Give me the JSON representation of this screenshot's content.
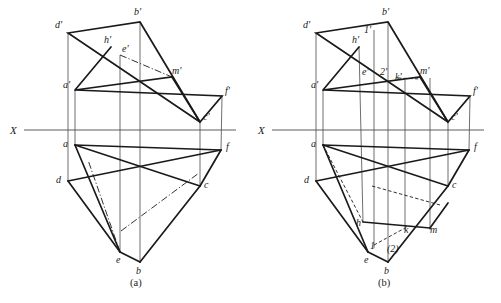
{
  "sheet": {
    "width": 501,
    "height": 303,
    "background": "#ffffff",
    "ink": "#1a1a1a",
    "thin_ink": "#4a4a4a"
  },
  "figures": [
    {
      "id": "figure-a",
      "caption": "(a)",
      "caption_pos": {
        "x": 130,
        "y": 286
      },
      "axis": {
        "name": "X",
        "label": "X",
        "label_pos": {
          "x": 10,
          "y": 134
        },
        "y": 130,
        "x1": 24,
        "x2": 236
      },
      "points": {
        "d_prime": {
          "label": "d'",
          "x": 68,
          "y": 33,
          "lx": 55,
          "ly": 28
        },
        "b_prime": {
          "label": "b'",
          "x": 140,
          "y": 22,
          "lx": 134,
          "ly": 15
        },
        "h_prime": {
          "label": "h'",
          "x": 111,
          "y": 47,
          "lx": 104,
          "ly": 43
        },
        "e_prime": {
          "label": "e'",
          "x": 120,
          "y": 55,
          "lx": 122,
          "ly": 52
        },
        "m_prime": {
          "label": "m'",
          "x": 172,
          "y": 77,
          "lx": 172,
          "ly": 74
        },
        "a_prime": {
          "label": "a'",
          "x": 75,
          "y": 90,
          "lx": 63,
          "ly": 88
        },
        "f_prime": {
          "label": "f'",
          "x": 222,
          "y": 96,
          "lx": 225,
          "ly": 94
        },
        "c_prime": {
          "label": "c'",
          "x": 200,
          "y": 122,
          "lx": 203,
          "ly": 120
        },
        "a": {
          "label": "a",
          "x": 75,
          "y": 145,
          "lx": 63,
          "ly": 147
        },
        "f": {
          "label": "f",
          "x": 221,
          "y": 150,
          "lx": 226,
          "ly": 150
        },
        "d": {
          "label": "d",
          "x": 68,
          "y": 181,
          "lx": 56,
          "ly": 183
        },
        "c": {
          "label": "c",
          "x": 200,
          "y": 186,
          "lx": 204,
          "ly": 188
        },
        "e": {
          "label": "e",
          "x": 120,
          "y": 252,
          "lx": 116,
          "ly": 263
        },
        "b": {
          "label": "b",
          "x": 140,
          "y": 262,
          "lx": 136,
          "ly": 274
        }
      },
      "solid_paths": [
        {
          "name": "top-view-triangle-dbm",
          "d": "M 68 33 L 140 22 L 200 122 Z"
        },
        {
          "name": "front-quad-a-m-c-f",
          "d": "M 75 90 L 172 77 L 200 122 L 222 96 Z"
        },
        {
          "name": "front-left-edge-a-h",
          "d": "M 75 90 L 111 47"
        },
        {
          "name": "bottom-poly-a-f",
          "d": "M 75 145 L 221 150"
        },
        {
          "name": "bottom-poly-a-c",
          "d": "M 75 145 L 200 186"
        },
        {
          "name": "bottom-poly-d-f",
          "d": "M 68 181 L 221 150"
        },
        {
          "name": "bottom-poly-a-e",
          "d": "M 75 145 L 120 252"
        },
        {
          "name": "bottom-poly-d-e",
          "d": "M 68 181 L 120 252"
        },
        {
          "name": "bottom-poly-e-b",
          "d": "M 120 252 L 140 262"
        },
        {
          "name": "bottom-poly-b-c",
          "d": "M 140 262 L 200 186"
        },
        {
          "name": "bottom-poly-c-f",
          "d": "M 200 186 L 221 150"
        }
      ],
      "thin_paths": [
        {
          "name": "proj-line-d",
          "d": "M 68 33 L 68 181"
        },
        {
          "name": "proj-line-a",
          "d": "M 75 90 L 75 145"
        },
        {
          "name": "proj-line-e",
          "d": "M 120 55 L 120 252"
        },
        {
          "name": "proj-line-b",
          "d": "M 140 22 L 140 262"
        },
        {
          "name": "proj-line-c",
          "d": "M 200 122 L 200 186"
        },
        {
          "name": "proj-line-f",
          "d": "M 222 96 L 221 150"
        }
      ],
      "dashdot_paths": [
        {
          "name": "center-line-e-m",
          "d": "M 120 55 L 172 77"
        },
        {
          "name": "center-line-e-mid",
          "d": "M 120 252 L 88 160"
        },
        {
          "name": "center-line-mid-c",
          "d": "M 121 231 L 199 173"
        }
      ]
    },
    {
      "id": "figure-b",
      "caption": "(b)",
      "caption_pos": {
        "x": 378,
        "y": 286
      },
      "axis": {
        "name": "X",
        "label": "X",
        "label_pos": {
          "x": 258,
          "y": 134
        },
        "y": 130,
        "x1": 272,
        "x2": 484
      },
      "points": {
        "d_prime": {
          "label": "d'",
          "x": 316,
          "y": 33,
          "lx": 303,
          "ly": 28
        },
        "b_prime": {
          "label": "b'",
          "x": 388,
          "y": 22,
          "lx": 382,
          "ly": 15
        },
        "one_prime": {
          "label": "1'",
          "x": 368,
          "y": 35,
          "lx": 364,
          "ly": 33
        },
        "h_prime": {
          "label": "h'",
          "x": 359,
          "y": 47,
          "lx": 352,
          "ly": 43
        },
        "e_prime": {
          "label": "e'",
          "x": 368,
          "y": 72,
          "lx": 362,
          "ly": 75
        },
        "two_prime": {
          "label": "2'",
          "x": 383,
          "y": 72,
          "lx": 380,
          "ly": 75
        },
        "k_prime": {
          "label": "k'",
          "x": 398,
          "y": 78,
          "lx": 395,
          "ly": 80
        },
        "m_prime": {
          "label": "m'",
          "x": 420,
          "y": 77,
          "lx": 420,
          "ly": 74
        },
        "a_prime": {
          "label": "a'",
          "x": 323,
          "y": 90,
          "lx": 311,
          "ly": 88
        },
        "f_prime": {
          "label": "f'",
          "x": 470,
          "y": 96,
          "lx": 473,
          "ly": 94
        },
        "c_prime": {
          "label": "c'",
          "x": 448,
          "y": 122,
          "lx": 451,
          "ly": 120
        },
        "a": {
          "label": "a",
          "x": 323,
          "y": 145,
          "lx": 311,
          "ly": 147
        },
        "f": {
          "label": "f",
          "x": 469,
          "y": 150,
          "lx": 474,
          "ly": 150
        },
        "d": {
          "label": "d",
          "x": 316,
          "y": 181,
          "lx": 304,
          "ly": 183
        },
        "c": {
          "label": "c",
          "x": 448,
          "y": 186,
          "lx": 452,
          "ly": 188
        },
        "h": {
          "label": "h",
          "x": 363,
          "y": 222,
          "lx": 356,
          "ly": 226
        },
        "k": {
          "label": "k",
          "x": 405,
          "y": 228,
          "lx": 404,
          "ly": 233
        },
        "m": {
          "label": "m",
          "x": 430,
          "y": 228,
          "lx": 430,
          "ly": 233
        },
        "one": {
          "label": "1",
          "x": 374,
          "y": 245,
          "lx": 370,
          "ly": 249
        },
        "two": {
          "label": "(2)",
          "x": 392,
          "y": 246,
          "lx": 387,
          "ly": 252
        },
        "e": {
          "label": "e",
          "x": 368,
          "y": 252,
          "lx": 364,
          "ly": 263
        },
        "b": {
          "label": "b",
          "x": 388,
          "y": 262,
          "lx": 384,
          "ly": 274
        }
      },
      "solid_paths": [
        {
          "name": "top-view-triangle-dbm",
          "d": "M 316 33 L 388 22 L 448 122 Z"
        },
        {
          "name": "front-quad-a-m-c-f",
          "d": "M 323 90 L 420 77 L 448 122 L 470 96 Z"
        },
        {
          "name": "front-left-edge-a-h",
          "d": "M 323 90 L 359 47"
        },
        {
          "name": "bottom-poly-a-f",
          "d": "M 323 145 L 469 150"
        },
        {
          "name": "bottom-poly-a-c",
          "d": "M 323 145 L 448 186"
        },
        {
          "name": "bottom-poly-d-f",
          "d": "M 316 181 L 469 150"
        },
        {
          "name": "bottom-poly-a-e",
          "d": "M 323 145 L 368 252"
        },
        {
          "name": "bottom-poly-d-e",
          "d": "M 316 181 L 368 252"
        },
        {
          "name": "bottom-poly-e-b",
          "d": "M 368 252 L 388 262"
        },
        {
          "name": "bottom-poly-b-c",
          "d": "M 388 262 L 448 186"
        },
        {
          "name": "bottom-poly-c-f",
          "d": "M 448 186 L 469 150"
        },
        {
          "name": "bottom-seg-h-k",
          "d": "M 363 222 L 430 228"
        },
        {
          "name": "bottom-seg-k-m",
          "d": "M 430 228 L 448 203"
        }
      ],
      "thin_paths": [
        {
          "name": "proj-line-d",
          "d": "M 316 33 L 316 181"
        },
        {
          "name": "proj-line-a",
          "d": "M 323 90 L 323 145"
        },
        {
          "name": "proj-line-h",
          "d": "M 359 47 L 363 222"
        },
        {
          "name": "proj-line-1",
          "d": "M 374 30 L 374 248"
        },
        {
          "name": "proj-line-b",
          "d": "M 388 22 L 388 262"
        },
        {
          "name": "proj-line-k",
          "d": "M 405 80 L 405 230"
        },
        {
          "name": "proj-line-m",
          "d": "M 430 78 L 430 230"
        },
        {
          "name": "proj-line-c",
          "d": "M 448 122 L 448 186"
        },
        {
          "name": "proj-line-f",
          "d": "M 470 96 L 469 150"
        }
      ],
      "dashed_paths": [
        {
          "name": "hidden-k-m-prime",
          "d": "M 398 78 L 420 79"
        },
        {
          "name": "hidden-a-h",
          "d": "M 323 145 L 363 222"
        },
        {
          "name": "hidden-mid-k",
          "d": "M 372 186 L 440 205"
        },
        {
          "name": "hidden-1-k",
          "d": "M 374 245 L 405 228"
        }
      ],
      "dashdot_paths": []
    }
  ]
}
